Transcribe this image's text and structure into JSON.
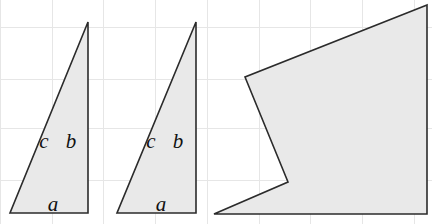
{
  "figure": {
    "canvas": {
      "width": 432,
      "height": 224
    },
    "background_color": "#ffffff",
    "grid": {
      "visible": true,
      "line_color": "#e6e6e6",
      "spacing_px": 51,
      "vertical_x": [
        0,
        52,
        103,
        155,
        207,
        259,
        310,
        362,
        414
      ],
      "horizontal_y": [
        27,
        79,
        128,
        180
      ]
    },
    "shape_style": {
      "fill_color": "#e9e9e9",
      "stroke_color": "#2b2b2b",
      "stroke_width": 1.6
    },
    "shapes": [
      {
        "name": "left-triangle",
        "type": "triangle",
        "points": "88,22 10,213 88,213",
        "labels": [
          {
            "text": "c",
            "x": 44,
            "y": 148
          },
          {
            "text": "b",
            "x": 71,
            "y": 148
          },
          {
            "text": "a",
            "x": 53,
            "y": 211
          }
        ]
      },
      {
        "name": "middle-triangle",
        "type": "triangle",
        "points": "196,22 117,213 196,213",
        "labels": [
          {
            "text": "c",
            "x": 151,
            "y": 148
          },
          {
            "text": "b",
            "x": 178,
            "y": 148
          },
          {
            "text": "a",
            "x": 161,
            "y": 211
          }
        ]
      },
      {
        "name": "right-concave-polygon",
        "type": "concave-polygon",
        "points": "427,5 245,77 288,182 214,214 427,214",
        "labels": []
      }
    ]
  }
}
